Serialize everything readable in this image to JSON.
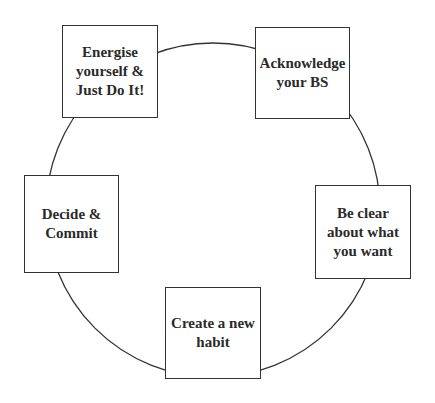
{
  "diagram": {
    "type": "cycle",
    "steps": [
      {
        "label": "Energise\nyourself &\nJust Do It!"
      },
      {
        "label": "Acknowledge\nyour BS"
      },
      {
        "label": "Be clear\nabout what\nyou want"
      },
      {
        "label": "Create a new\nhabit"
      },
      {
        "label": "Decide &\nCommit"
      }
    ],
    "colors": {
      "line": "#333333",
      "text": "#2a2a2a",
      "background": "#ffffff"
    }
  }
}
